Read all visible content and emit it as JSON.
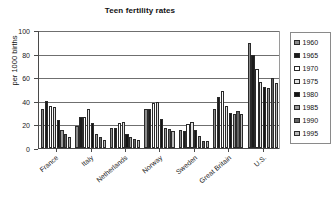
{
  "chart_data": {
    "type": "bar",
    "title": "Teen fertility rates",
    "xlabel": "",
    "ylabel": "per 1000 births",
    "ylim": [
      0,
      100
    ],
    "yticks": [
      0,
      20,
      40,
      60,
      80,
      100
    ],
    "grid": true,
    "legend_position": "right",
    "categories": [
      "France",
      "Italy",
      "Netherlands",
      "Norway",
      "Sweden",
      "Great Britain",
      "U.S."
    ],
    "series": [
      {
        "name": "1960",
        "color": "#8c8c8c",
        "values": [
          33,
          19,
          17,
          33,
          15,
          33,
          89
        ]
      },
      {
        "name": "1965",
        "color": "#1c1c1c",
        "values": [
          40,
          26,
          17,
          33,
          14,
          43,
          79
        ]
      },
      {
        "name": "1970",
        "color": "#ffffff",
        "values": [
          36,
          26,
          21,
          38,
          20,
          48,
          67
        ]
      },
      {
        "name": "1975",
        "color": "#e3e3e3",
        "values": [
          35,
          33,
          22,
          39,
          22,
          36,
          56
        ]
      },
      {
        "name": "1980",
        "color": "#141414",
        "values": [
          24,
          21,
          12,
          25,
          15,
          30,
          52
        ]
      },
      {
        "name": "1985",
        "color": "#9a9a9a",
        "values": [
          15,
          12,
          9,
          17,
          10,
          29,
          51
        ]
      },
      {
        "name": "1990",
        "color": "#636363",
        "values": [
          12,
          9,
          8,
          16,
          6,
          31,
          59
        ]
      },
      {
        "name": "1995",
        "color": "#b8b8b8",
        "values": [
          9,
          7,
          7,
          14,
          6,
          29,
          55
        ]
      }
    ]
  }
}
